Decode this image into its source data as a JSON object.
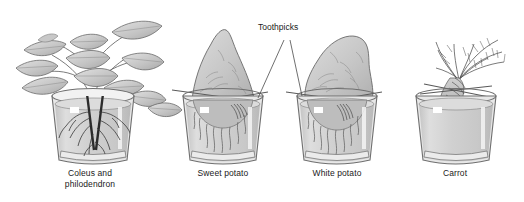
{
  "figure": {
    "title_visible": false,
    "background_color": "#ffffff",
    "ink_color": "#333333",
    "glass_fill": "#d2d2d2",
    "glass_outline": "#6f6f6f",
    "tuber_fill": "#c9c9c9",
    "leaf_fill": "#c4c4c4",
    "annotation": {
      "label": "Toothpicks",
      "x": 258,
      "y": 26
    },
    "specimens": [
      {
        "id": "coleus-philodendron",
        "caption": "Coleus and\nphilodendron",
        "caption_x": 15,
        "caption_y": 168,
        "caption_width": 150,
        "jar_center_x": 93,
        "has_toothpicks": false,
        "root_style": "dark-branching",
        "top_growth": "leafy-stems"
      },
      {
        "id": "sweet-potato",
        "caption": "Sweet potato",
        "caption_x": 163,
        "caption_y": 168,
        "caption_width": 120,
        "jar_center_x": 222,
        "has_toothpicks": true,
        "root_style": "fine-wavy",
        "top_growth": "tapered-tuber"
      },
      {
        "id": "white-potato",
        "caption": "White potato",
        "caption_x": 277,
        "caption_y": 168,
        "caption_width": 120,
        "jar_center_x": 336,
        "has_toothpicks": true,
        "root_style": "fine-wavy",
        "top_growth": "lumpy-tuber"
      },
      {
        "id": "carrot",
        "caption": "Carrot",
        "caption_x": 400,
        "caption_y": 168,
        "caption_width": 110,
        "jar_center_x": 455,
        "has_toothpicks": true,
        "root_style": "taproot",
        "top_growth": "feathery-foliage"
      }
    ]
  }
}
